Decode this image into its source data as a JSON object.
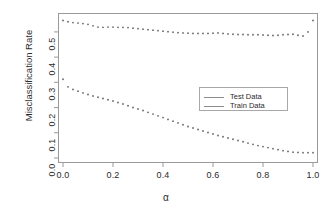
{
  "chart_data": {
    "type": "scatter",
    "title": "",
    "xlabel": "α",
    "ylabel": "Misclassification Rate",
    "xlim": [
      -0.02,
      1.02
    ],
    "ylim": [
      -0.02,
      0.575
    ],
    "grid": false,
    "legend_position": "center-right",
    "xticks": [
      "0.0",
      "0.2",
      "0.4",
      "0.6",
      "0.8",
      "1.0"
    ],
    "xtick_values": [
      0.0,
      0.2,
      0.4,
      0.6,
      0.8,
      1.0
    ],
    "yticks": [
      "0.0",
      "0.1",
      "0.2",
      "0.3",
      "0.4",
      "0.5"
    ],
    "ytick_values": [
      0.0,
      0.1,
      0.2,
      0.3,
      0.4,
      0.5
    ],
    "x": [
      0.0,
      0.02,
      0.04,
      0.06,
      0.08,
      0.1,
      0.12,
      0.14,
      0.16,
      0.18,
      0.2,
      0.22,
      0.24,
      0.26,
      0.28,
      0.3,
      0.32,
      0.34,
      0.36,
      0.38,
      0.4,
      0.42,
      0.44,
      0.46,
      0.48,
      0.5,
      0.52,
      0.54,
      0.56,
      0.58,
      0.6,
      0.62,
      0.64,
      0.66,
      0.68,
      0.7,
      0.72,
      0.74,
      0.76,
      0.78,
      0.8,
      0.82,
      0.84,
      0.86,
      0.88,
      0.9,
      0.92,
      0.94,
      0.96,
      0.98,
      1.0
    ],
    "series": [
      {
        "name": "Test Data",
        "color": "#6e6e6e",
        "values": [
          0.545,
          0.54,
          0.537,
          0.535,
          0.533,
          0.53,
          0.524,
          0.519,
          0.518,
          0.519,
          0.519,
          0.518,
          0.518,
          0.517,
          0.515,
          0.513,
          0.511,
          0.509,
          0.507,
          0.505,
          0.503,
          0.501,
          0.499,
          0.497,
          0.496,
          0.495,
          0.494,
          0.494,
          0.494,
          0.494,
          0.495,
          0.496,
          0.494,
          0.492,
          0.491,
          0.49,
          0.49,
          0.489,
          0.489,
          0.489,
          0.488,
          0.487,
          0.486,
          0.487,
          0.489,
          0.49,
          0.491,
          0.487,
          0.484,
          0.5,
          0.545
        ]
      },
      {
        "name": "Train Data",
        "color": "#6e6e6e",
        "values": [
          0.312,
          0.282,
          0.272,
          0.265,
          0.258,
          0.252,
          0.246,
          0.241,
          0.236,
          0.231,
          0.226,
          0.22,
          0.214,
          0.207,
          0.2,
          0.194,
          0.188,
          0.181,
          0.174,
          0.167,
          0.16,
          0.153,
          0.146,
          0.139,
          0.132,
          0.125,
          0.119,
          0.113,
          0.107,
          0.101,
          0.095,
          0.089,
          0.084,
          0.079,
          0.074,
          0.069,
          0.064,
          0.059,
          0.054,
          0.049,
          0.045,
          0.041,
          0.037,
          0.033,
          0.029,
          0.026,
          0.023,
          0.022,
          0.021,
          0.021,
          0.021
        ]
      }
    ]
  },
  "legend": {
    "entries": [
      {
        "label": "Test Data"
      },
      {
        "label": "Train Data"
      }
    ]
  },
  "axes": {
    "x_title": "α",
    "y_title": "Misclassification Rate"
  }
}
